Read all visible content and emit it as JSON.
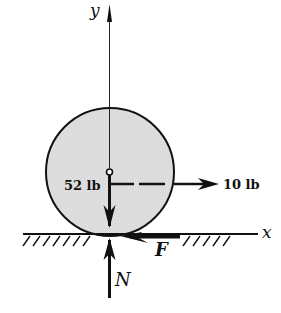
{
  "diagram": {
    "type": "free-body-diagram",
    "axes": {
      "x_label": "x",
      "y_label": "y"
    },
    "body": {
      "shape": "circle",
      "fill": "#dcdcdc",
      "stroke": "#111111"
    },
    "forces": [
      {
        "id": "weight",
        "label": "52 lb",
        "direction": "down"
      },
      {
        "id": "applied",
        "label": "10 lb",
        "direction": "right"
      },
      {
        "id": "friction",
        "label": "F",
        "direction": "left"
      },
      {
        "id": "normal",
        "label": "N",
        "direction": "up"
      }
    ],
    "ground": {
      "hatched": true
    }
  }
}
